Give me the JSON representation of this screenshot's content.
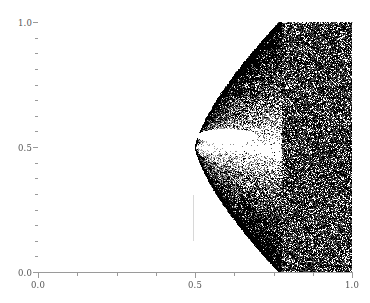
{
  "figure": {
    "background": "#ffffff",
    "foreground": "#000000",
    "axis_color": "#9a9a9a",
    "tick_label_color": "#555555"
  },
  "axes": {
    "x_ticklabels": [
      "0.0",
      "0.5",
      "1.0"
    ],
    "y_ticklabels": [
      "0.0",
      "0.5",
      "1.0"
    ],
    "x_tick_values": [
      0.0,
      0.5,
      1.0
    ],
    "y_tick_values": [
      0.0,
      0.5,
      1.0
    ],
    "x_minor_tick_values": [
      0.125,
      0.25,
      0.375,
      0.625,
      0.75,
      0.875
    ],
    "y_minor_tick_values": [
      0.0625,
      0.125,
      0.1875,
      0.25,
      0.3125,
      0.375,
      0.4375,
      0.5625,
      0.625,
      0.6875,
      0.75,
      0.8125,
      0.875,
      0.9375
    ],
    "xlim": [
      0.0,
      1.0
    ],
    "ylim": [
      0.0,
      1.0
    ],
    "xlabel": "",
    "ylabel": "",
    "title": "",
    "grid": false,
    "spines": [
      "left",
      "bottom",
      "top"
    ]
  },
  "chart_data": {
    "type": "scatter",
    "title": "",
    "xlabel": "",
    "ylabel": "",
    "xlim": [
      0.0,
      1.0
    ],
    "ylim": [
      0.0,
      1.0
    ],
    "grid": false,
    "legend": null,
    "marker": {
      "color": "#000000",
      "size_px": 1,
      "alpha": 0.55
    },
    "cusp_point": [
      0.5,
      0.5
    ],
    "point_count": 60000,
    "region": {
      "x_start": 0.5,
      "x_end": 1.0,
      "upper_boundary_note": "y_upper = 0.5 + 1.28*(x-0.5)^0.72, clipped at 1.0",
      "lower_boundary_note": "y_lower = 0.5 - 1.28*(x-0.5)^0.72, clipped at 0.0",
      "void": {
        "shape": "lens",
        "x_range": [
          0.505,
          0.7
        ],
        "center": [
          0.6,
          0.545
        ],
        "half_width": 0.098,
        "half_height": 0.03
      }
    },
    "annotations": [
      {
        "type": "vline-fragment",
        "x": 0.495,
        "y_range": [
          0.21,
          0.4
        ],
        "color": "#d8d8d8"
      }
    ],
    "series": [
      {
        "name": "attractor",
        "color": "#000000",
        "x": [
          0.5,
          0.55,
          0.6,
          0.65,
          0.7,
          0.75,
          0.8,
          0.85,
          0.9,
          0.95,
          1.0
        ],
        "y_upper": [
          0.5,
          0.628,
          0.711,
          0.778,
          0.836,
          0.888,
          0.936,
          0.981,
          1.0,
          1.0,
          1.0
        ],
        "y_lower": [
          0.5,
          0.372,
          0.289,
          0.222,
          0.164,
          0.112,
          0.064,
          0.019,
          0.0,
          0.0,
          0.0
        ]
      }
    ]
  }
}
